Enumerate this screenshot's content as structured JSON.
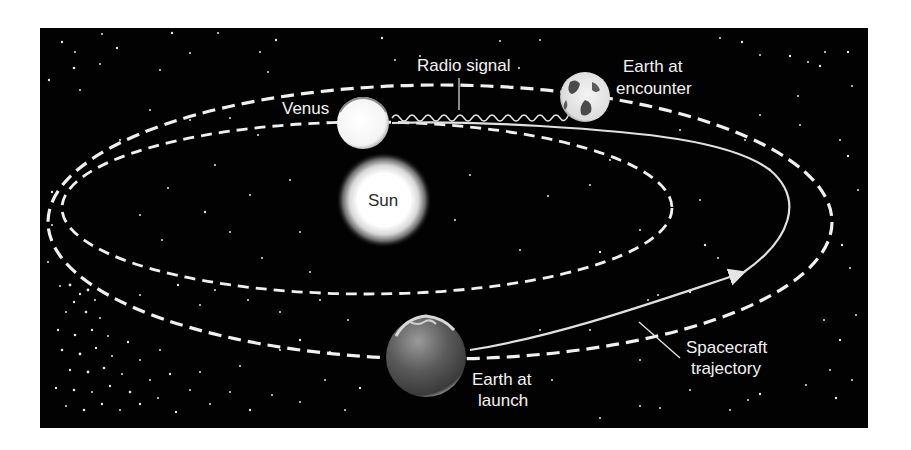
{
  "diagram": {
    "type": "orbital-trajectory-illustration",
    "background_color": "#020202",
    "orbit_color": "#f0f0f0",
    "labels": {
      "radio_signal": "Radio signal",
      "venus": "Venus",
      "sun": "Sun",
      "earth_encounter_line1": "Earth at",
      "earth_encounter_line2": "encounter",
      "earth_launch_line1": "Earth at",
      "earth_launch_line2": "launch",
      "spacecraft_line1": "Spacecraft",
      "spacecraft_line2": "trajectory"
    },
    "bodies": [
      {
        "name": "Sun",
        "role": "central star"
      },
      {
        "name": "Venus",
        "role": "target planet, at encounter"
      },
      {
        "name": "Earth at encounter",
        "role": "Earth position when spacecraft reaches Venus"
      },
      {
        "name": "Earth at launch",
        "role": "Earth position at spacecraft launch"
      }
    ],
    "orbits": [
      {
        "name": "Earth orbit",
        "style": "dashed"
      },
      {
        "name": "Venus orbit",
        "style": "dashed"
      }
    ],
    "paths": [
      {
        "name": "Spacecraft trajectory",
        "style": "solid with arrow",
        "from": "Earth at launch",
        "to": "Venus"
      },
      {
        "name": "Radio signal",
        "style": "wavy line",
        "from": "Venus",
        "to": "Earth at encounter"
      }
    ]
  }
}
